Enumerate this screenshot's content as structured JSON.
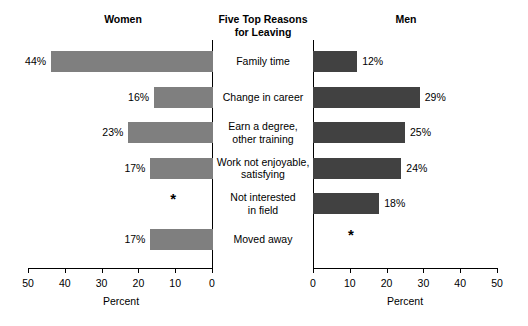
{
  "headers": {
    "left": "Women",
    "center_line1": "Five Top Reasons",
    "center_line2": "for Leaving",
    "right": "Men"
  },
  "axis": {
    "title_left": "Percent",
    "title_right": "Percent",
    "ticks_left": [
      "50",
      "40",
      "30",
      "20",
      "10",
      "0"
    ],
    "ticks_right": [
      "0",
      "10",
      "20",
      "30",
      "40",
      "50"
    ],
    "min": 0,
    "max": 50,
    "step": 10
  },
  "suppressed_marker": "*",
  "colors": {
    "women_bar": "#7f7f7f",
    "men_bar": "#414141",
    "axis": "#000000",
    "background": "#ffffff"
  },
  "rows": [
    {
      "reason_line1": "Family time",
      "reason_line2": "",
      "women_value": 44,
      "women_label": "44%",
      "men_value": 12,
      "men_label": "12%"
    },
    {
      "reason_line1": "Change in career",
      "reason_line2": "",
      "women_value": 16,
      "women_label": "16%",
      "men_value": 29,
      "men_label": "29%"
    },
    {
      "reason_line1": "Earn a degree,",
      "reason_line2": "other training",
      "women_value": 23,
      "women_label": "23%",
      "men_value": 25,
      "men_label": "25%"
    },
    {
      "reason_line1": "Work not enjoyable,",
      "reason_line2": "satisfying",
      "women_value": 17,
      "women_label": "17%",
      "men_value": 24,
      "men_label": "24%"
    },
    {
      "reason_line1": "Not interested",
      "reason_line2": "in field",
      "women_value": null,
      "women_label": "*",
      "men_value": 18,
      "men_label": "18%"
    },
    {
      "reason_line1": "Moved away",
      "reason_line2": "",
      "women_value": 17,
      "women_label": "17%",
      "men_value": null,
      "men_label": "*"
    }
  ],
  "chart_data": {
    "type": "bar",
    "title": "Five Top Reasons for Leaving",
    "orientation": "horizontal",
    "layout": "back-to-back population pyramid",
    "categories": [
      "Family time",
      "Change in career",
      "Earn a degree, other training",
      "Work not enjoyable, satisfying",
      "Not interested in field",
      "Moved away"
    ],
    "series": [
      {
        "name": "Women",
        "side": "left",
        "color": "#7f7f7f",
        "values": [
          44,
          16,
          23,
          17,
          null,
          17
        ],
        "labels": [
          "44%",
          "16%",
          "23%",
          "17%",
          "*",
          "17%"
        ]
      },
      {
        "name": "Men",
        "side": "right",
        "color": "#414141",
        "values": [
          12,
          29,
          25,
          24,
          18,
          null
        ],
        "labels": [
          "12%",
          "29%",
          "25%",
          "24%",
          "18%",
          "*"
        ]
      }
    ],
    "xlabel": "Percent",
    "ylabel": "",
    "xlim": [
      0,
      50
    ],
    "xticks": [
      0,
      10,
      20,
      30,
      40,
      50
    ],
    "grid": false,
    "legend": "column headers (Women / Men)"
  }
}
